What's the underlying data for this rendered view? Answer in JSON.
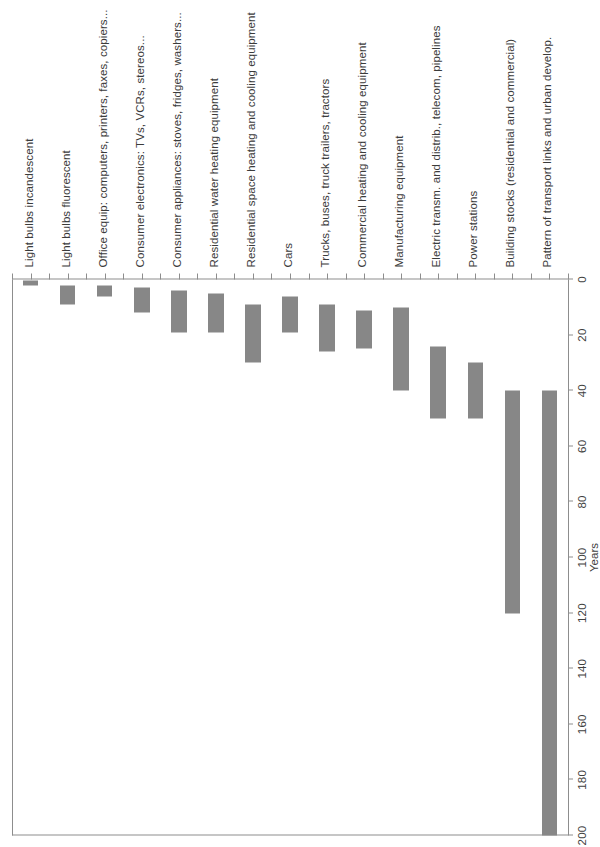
{
  "chart_data": {
    "type": "bar",
    "orientation": "floating-range-bars",
    "title": "",
    "subtitle": "",
    "xlabel": "",
    "ylabel": "Years",
    "value_axis_title": "Years",
    "ylim": [
      0,
      200
    ],
    "axis_ticks": [
      0,
      20,
      40,
      60,
      80,
      100,
      120,
      140,
      160,
      180,
      200
    ],
    "tick_labels": [
      "0",
      "20",
      "40",
      "60",
      "80",
      "100",
      "120",
      "140",
      "160",
      "180",
      "200"
    ],
    "grid": false,
    "legend": "none",
    "bar_color": "#878787",
    "axis_color": "#8d8d8d",
    "categories": [
      "Light bulbs incandescent",
      "Light bulbs fluorescent",
      "Office equip: computers, printers, faxes, copiers...",
      "Consumer electronics: TVs, VCRs, stereos...",
      "Consumer appliances: stoves, fridges, washers...",
      "Residential water heating equipment",
      "Residential space heating and cooling equipment",
      "Cars",
      "Trucks, buses, truck trailers, tractors",
      "Commercial heating and cooling equipment",
      "Manufacturing equipment",
      "Electric transm. and distrib., telecom, pipelines",
      "Power stations",
      "Building stocks (residential and commercial)",
      "Pattern of transport links and urban develop."
    ],
    "ranges": [
      [
        0.5,
        2
      ],
      [
        2,
        9
      ],
      [
        2,
        6
      ],
      [
        3,
        12
      ],
      [
        4,
        19
      ],
      [
        5,
        19
      ],
      [
        9,
        30
      ],
      [
        6,
        19
      ],
      [
        9,
        26
      ],
      [
        11,
        25
      ],
      [
        10,
        40
      ],
      [
        24,
        50
      ],
      [
        30,
        50
      ],
      [
        40,
        120
      ],
      [
        40,
        200
      ]
    ],
    "low_label": "Low",
    "high_label": "High"
  }
}
